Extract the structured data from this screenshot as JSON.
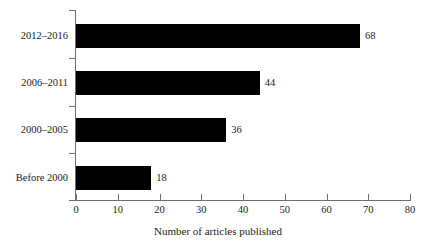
{
  "chart_data": {
    "type": "bar",
    "orientation": "horizontal",
    "title": "",
    "xlabel": "Number of articles published",
    "ylabel": "",
    "categories": [
      "2012–2016",
      "2006–2011",
      "2000–2005",
      "Before 2000"
    ],
    "values": [
      68,
      44,
      36,
      18
    ],
    "value_labels": [
      "68",
      "44",
      "36",
      "18"
    ],
    "xlim": [
      0,
      80
    ],
    "xticks": [
      0,
      10,
      20,
      30,
      40,
      50,
      60,
      70,
      80
    ],
    "xtick_labels": [
      "0",
      "10",
      "20",
      "30",
      "40",
      "50",
      "60",
      "70",
      "80"
    ],
    "grid": false,
    "legend": false,
    "bar_color": "#000000",
    "axis_color": "#6e6e6e",
    "text_color": "#1c1c1c",
    "background": "#ffffff"
  }
}
